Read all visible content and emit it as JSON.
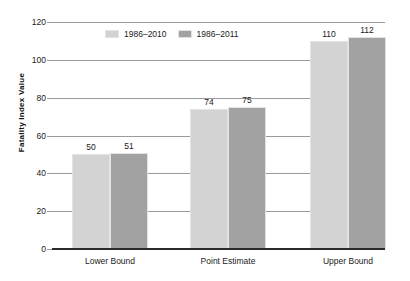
{
  "chart_data": {
    "type": "bar",
    "title": "",
    "subtitle": "",
    "xlabel": "",
    "ylabel": "Fatality Index Value",
    "categories": [
      "Lower Bound",
      "Point Estimate",
      "Upper Bound"
    ],
    "series": [
      {
        "name": "1986–2010",
        "values": [
          50,
          74,
          110
        ],
        "color": "#d3d3d3"
      },
      {
        "name": "1986–2011",
        "values": [
          51,
          75,
          112
        ],
        "color": "#a2a2a2"
      }
    ],
    "ylim": [
      0,
      120
    ],
    "yticks": [
      0,
      20,
      40,
      60,
      80,
      100,
      120
    ],
    "ytick_labels": [
      "0",
      "20",
      "40",
      "60",
      "80",
      "100",
      "120"
    ],
    "grid": true,
    "grid_axis": "y",
    "legend_position": "upper left (inside plot)",
    "data_labels": true,
    "data_label_values": [
      [
        "50",
        "74",
        "110"
      ],
      [
        "51",
        "75",
        "112"
      ]
    ],
    "axis_color": "#2b2b2b",
    "gridline_color": "#9a9a9a",
    "background": "#ffffff"
  },
  "legend": {
    "items": [
      {
        "label": "1986–2010",
        "color": "#d3d3d3"
      },
      {
        "label": "1986–2011",
        "color": "#a2a2a2"
      }
    ]
  }
}
